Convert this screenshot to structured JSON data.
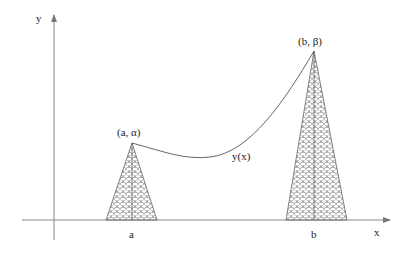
{
  "diagram": {
    "axes": {
      "x_label": "x",
      "y_label": "y",
      "origin": [
        54,
        220
      ],
      "x_axis_end": 390,
      "y_axis_top": 15,
      "y_axis_bottom": 240
    },
    "curve": {
      "label": "y(x)",
      "start": {
        "label": "(a, α)",
        "x": 132,
        "y": 143
      },
      "end": {
        "label": "(b, β)",
        "x": 314,
        "y": 51
      }
    },
    "left_spike": {
      "tick_label": "a",
      "apex": [
        132,
        143
      ],
      "base_left": 106,
      "base_right": 157
    },
    "right_spike": {
      "tick_label": "b",
      "apex": [
        314,
        51
      ],
      "base_left": 286,
      "base_right": 347
    },
    "colors": {
      "line": "#555555",
      "hatch": "#666666",
      "background": "#ffffff"
    }
  }
}
